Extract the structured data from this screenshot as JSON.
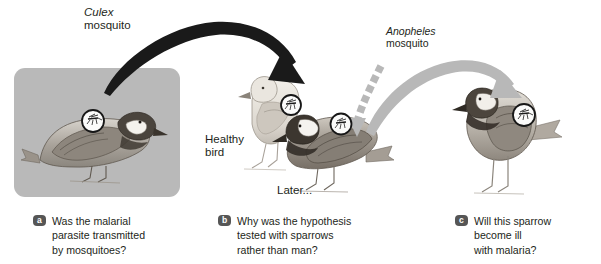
{
  "figure": {
    "type": "science-diagram"
  },
  "panel_a": {
    "box_color": "#b9b9b9",
    "bird": "sparrow-perched",
    "magnifier": "mosquito-on-bird"
  },
  "panel_b": {
    "healthy_label": "Healthy\nbird",
    "later_label": "Later...",
    "birds": [
      "healthy-sparrow",
      "infected-sparrow"
    ]
  },
  "panel_c": {
    "bird": "standing-sparrow",
    "magnifier": "mosquito-on-bird"
  },
  "arrows": {
    "culex": {
      "genus": "Culex",
      "common": "mosquito",
      "color": "#1a1a1a",
      "style": "solid-tapered-curve"
    },
    "anopheles": {
      "genus": "Anopheles",
      "common": "mosquito",
      "color": "#b0b0b0",
      "style_down": "dashed-segments",
      "style_right": "solid-tapered-curve"
    }
  },
  "captions": [
    {
      "id": "a",
      "badge": "a",
      "text": "Was the malarial\nparasite transmitted\nby mosquitoes?"
    },
    {
      "id": "b",
      "badge": "b",
      "text": "Why was the hypothesis\ntested with sparrows\nrather than man?"
    },
    {
      "id": "c",
      "badge": "c",
      "text": "Will this sparrow\nbecome ill\nwith malaria?"
    }
  ],
  "colors": {
    "badge_bg": "#565656",
    "text": "#231f20",
    "panel_gray": "#b9b9b9",
    "arrow_dark": "#1a1a1a",
    "arrow_light": "#b0b0b0"
  }
}
